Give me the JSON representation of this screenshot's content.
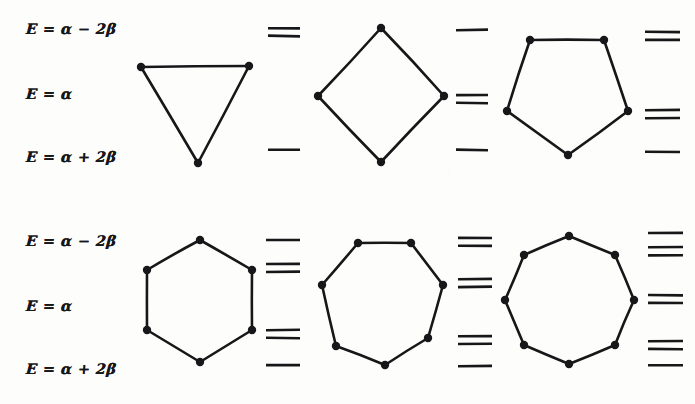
{
  "figure": {
    "background_color": "#fdfdfb",
    "ink_color": "#17171a",
    "width": 695,
    "height": 404
  },
  "rows": [
    {
      "id": "row-top",
      "labels": [
        {
          "id": "label-top-antibonding",
          "text": "E = α − 2β",
          "x": 26,
          "y": 20
        },
        {
          "id": "label-top-nonbonding",
          "text": "E = α",
          "x": 26,
          "y": 85
        },
        {
          "id": "label-top-bonding",
          "text": "E = α + 2β",
          "x": 26,
          "y": 148
        }
      ],
      "panels": [
        {
          "id": "panel-triangle",
          "name": "cyclopropenyl",
          "sides": 3,
          "vertices": [
            [
              141,
              67
            ],
            [
              249,
              66
            ],
            [
              198,
              163
            ]
          ],
          "levels": [
            {
              "y": 32,
              "degeneracy": 2,
              "x1": 268,
              "x2": 300
            },
            {
              "y": 150,
              "degeneracy": 1,
              "x1": 268,
              "x2": 300
            }
          ]
        },
        {
          "id": "panel-square",
          "name": "cyclobutadienyl",
          "sides": 4,
          "vertices": [
            [
              381,
              28
            ],
            [
              444,
              96
            ],
            [
              381,
              162
            ],
            [
              318,
              96
            ]
          ],
          "levels": [
            {
              "y": 30,
              "degeneracy": 1,
              "x1": 456,
              "x2": 488
            },
            {
              "y": 99,
              "degeneracy": 2,
              "x1": 456,
              "x2": 488
            },
            {
              "y": 150,
              "degeneracy": 1,
              "x1": 456,
              "x2": 488
            }
          ]
        },
        {
          "id": "panel-pentagon",
          "name": "cyclopentadienyl",
          "sides": 5,
          "vertices": [
            [
              530,
              40
            ],
            [
              604,
              40
            ],
            [
              628,
              111
            ],
            [
              568,
              155
            ],
            [
              507,
              111
            ]
          ],
          "levels": [
            {
              "y": 36,
              "degeneracy": 2,
              "x1": 645,
              "x2": 680
            },
            {
              "y": 114,
              "degeneracy": 2,
              "x1": 645,
              "x2": 680
            },
            {
              "y": 152,
              "degeneracy": 1,
              "x1": 645,
              "x2": 680
            }
          ]
        }
      ]
    },
    {
      "id": "row-bottom",
      "labels": [
        {
          "id": "label-bottom-antibonding",
          "text": "E = α − 2β",
          "x": 26,
          "y": 232
        },
        {
          "id": "label-bottom-nonbonding",
          "text": "E = α",
          "x": 26,
          "y": 297
        },
        {
          "id": "label-bottom-bonding",
          "text": "E = α + 2β",
          "x": 26,
          "y": 360
        }
      ],
      "panels": [
        {
          "id": "panel-hexagon",
          "name": "benzene",
          "sides": 6,
          "vertices": [
            [
              200,
              240
            ],
            [
              252,
              270
            ],
            [
              252,
              330
            ],
            [
              200,
              362
            ],
            [
              147,
              330
            ],
            [
              147,
              270
            ]
          ],
          "levels": [
            {
              "y": 240,
              "degeneracy": 1,
              "x1": 266,
              "x2": 300
            },
            {
              "y": 268,
              "degeneracy": 2,
              "x1": 266,
              "x2": 300
            },
            {
              "y": 334,
              "degeneracy": 2,
              "x1": 266,
              "x2": 300
            },
            {
              "y": 365,
              "degeneracy": 1,
              "x1": 266,
              "x2": 300
            }
          ]
        },
        {
          "id": "panel-heptagon",
          "name": "cycloheptatrienyl",
          "sides": 7,
          "vertices": [
            [
              358,
              243
            ],
            [
              411,
              243
            ],
            [
              443,
              285
            ],
            [
              428,
              338
            ],
            [
              385,
              365
            ],
            [
              336,
              346
            ],
            [
              322,
              285
            ]
          ],
          "levels": [
            {
              "y": 242,
              "degeneracy": 2,
              "x1": 458,
              "x2": 492
            },
            {
              "y": 283,
              "degeneracy": 2,
              "x1": 458,
              "x2": 492
            },
            {
              "y": 340,
              "degeneracy": 2,
              "x1": 458,
              "x2": 492
            },
            {
              "y": 366,
              "degeneracy": 1,
              "x1": 458,
              "x2": 492
            }
          ]
        },
        {
          "id": "panel-octagon",
          "name": "cyclooctatetraene",
          "sides": 8,
          "vertices": [
            [
              569,
              236
            ],
            [
              615,
              255
            ],
            [
              634,
              300
            ],
            [
              615,
              345
            ],
            [
              569,
              364
            ],
            [
              524,
              345
            ],
            [
              505,
              300
            ],
            [
              524,
              255
            ]
          ],
          "levels": [
            {
              "y": 233,
              "degeneracy": 1,
              "x1": 648,
              "x2": 683
            },
            {
              "y": 251,
              "degeneracy": 2,
              "x1": 648,
              "x2": 683
            },
            {
              "y": 299,
              "degeneracy": 2,
              "x1": 648,
              "x2": 683
            },
            {
              "y": 345,
              "degeneracy": 2,
              "x1": 648,
              "x2": 683
            },
            {
              "y": 365,
              "degeneracy": 1,
              "x1": 648,
              "x2": 683
            }
          ]
        }
      ]
    }
  ],
  "style": {
    "bond_width": 2.6,
    "vertex_radius": 4.2,
    "level_width": 2.6,
    "degenerate_gap": 8
  }
}
